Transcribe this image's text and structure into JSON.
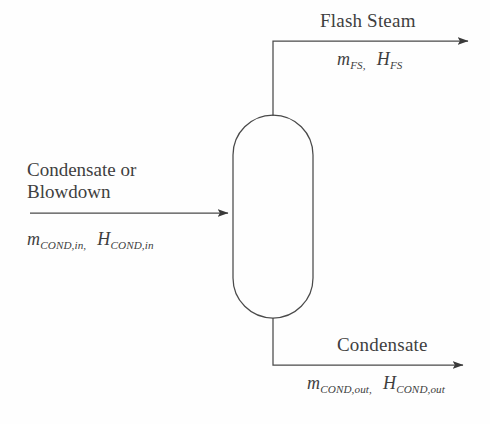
{
  "diagram": {
    "background_color": "#fefefe",
    "line_color": "#4a4a4a",
    "text_color": "#3f3f3f",
    "vessel": {
      "name": "flash-tank-vessel",
      "shape": "vertical-capsule"
    },
    "streams": {
      "flash_steam": {
        "label": "Flash Steam",
        "mass_symbol": "m",
        "mass_subscript": "FS,",
        "enthalpy_symbol": "H",
        "enthalpy_subscript": "FS",
        "direction": "outlet-top"
      },
      "inlet": {
        "label_line1": "Condensate or",
        "label_line2": "Blowdown",
        "mass_symbol": "m",
        "mass_subscript": "COND,in,",
        "enthalpy_symbol": "H",
        "enthalpy_subscript": "COND,in",
        "direction": "inlet-left"
      },
      "condensate_out": {
        "label": "Condensate",
        "mass_symbol": "m",
        "mass_subscript": "COND,out,",
        "enthalpy_symbol": "H",
        "enthalpy_subscript": "COND,out",
        "direction": "outlet-bottom"
      }
    }
  }
}
